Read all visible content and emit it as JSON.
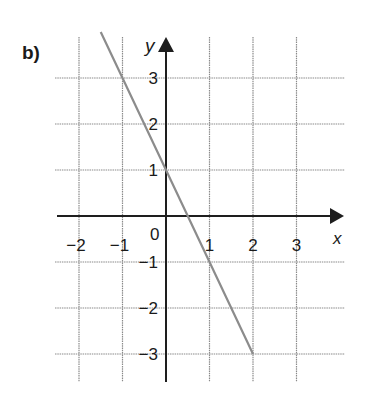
{
  "part_label": "b)",
  "chart_data": {
    "type": "line",
    "title": "",
    "xlabel": "x",
    "ylabel": "y",
    "xlim": [
      -2.5,
      3.5
    ],
    "ylim": [
      -3.5,
      3.5
    ],
    "grid": true,
    "x_ticks": [
      -2,
      -1,
      0,
      1,
      2,
      3
    ],
    "y_ticks": [
      -3,
      -2,
      -1,
      1,
      2,
      3
    ],
    "x_tick_labels": [
      "−2",
      "−1",
      "0",
      "1",
      "2",
      "3"
    ],
    "y_tick_labels": [
      "−3",
      "−2",
      "−1",
      "1",
      "2",
      "3"
    ],
    "origin_label": "0",
    "series": [
      {
        "name": "y = -2x + 1",
        "x": [
          -1.5,
          -1,
          0,
          1,
          2
        ],
        "y": [
          4,
          3,
          1,
          -1,
          -3
        ],
        "color": "#8c8c8c"
      }
    ]
  },
  "colors": {
    "axis": "#1e1e1e",
    "grid": "#8a8a8a",
    "line": "#8c8c8c",
    "text": "#1a1a1a"
  }
}
